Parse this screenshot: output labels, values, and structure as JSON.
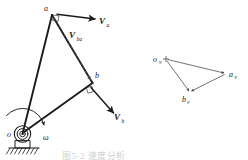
{
  "figure": {
    "caption_partial": "图5-2 速度分析",
    "colors": {
      "ink": "#1b1b1b",
      "thin_ink": "#3a3a3a",
      "dashed": "#555555",
      "background": "#ffffff",
      "caption_faded": "#cfcfcf"
    }
  },
  "mechanism": {
    "name": "four-bar-linkage",
    "points": [
      {
        "id": "o",
        "label": "o",
        "x": 22,
        "y": 134
      },
      {
        "id": "a",
        "label": "a",
        "x": 52,
        "y": 14
      },
      {
        "id": "b",
        "label": "b",
        "x": 93,
        "y": 83
      }
    ],
    "links": [
      {
        "id": "link-oa",
        "from": "o",
        "to": "a"
      },
      {
        "id": "link-ab",
        "from": "a",
        "to": "b"
      },
      {
        "id": "link-ob",
        "from": "o",
        "to": "b"
      }
    ],
    "ground_support": {
      "id": "ground-pivot",
      "label": "fixed-pivot-o",
      "x": 22,
      "y": 134
    },
    "angular_velocity": {
      "symbol": "ω",
      "label_x": 43,
      "label_y": 137,
      "direction": "clockwise"
    },
    "right_angle_markers": [
      {
        "id": "right-angle-a",
        "x": 55,
        "y": 16
      },
      {
        "id": "right-angle-b",
        "x": 89,
        "y": 90
      }
    ]
  },
  "vectors": [
    {
      "id": "v-a",
      "symbol": "V",
      "subscript": "a",
      "label_x": 99,
      "label_y": 23,
      "x1": 56,
      "y1": 14,
      "x2": 95,
      "y2": 18,
      "style": "solid"
    },
    {
      "id": "v-ba",
      "symbol": "V",
      "subscript": "ba",
      "label_x": 72,
      "label_y": 38,
      "x1": 55,
      "y1": 17,
      "x2": 91,
      "y2": 80,
      "style": "dashed"
    },
    {
      "id": "v-b",
      "symbol": "V",
      "subscript": "b",
      "label_x": 116,
      "label_y": 119,
      "x1": 91,
      "y1": 87,
      "x2": 113,
      "y2": 113,
      "style": "solid"
    }
  ],
  "velocity_polygon": {
    "name": "velocity-polygon",
    "pole": {
      "id": "ov",
      "symbol": "o",
      "subscript": "v",
      "x": 166,
      "y": 59,
      "label_x": 155,
      "label_y": 62
    },
    "vertices": [
      {
        "id": "av",
        "symbol": "a",
        "subscript": "v",
        "x": 225,
        "y": 74,
        "label_x": 229,
        "label_y": 76
      },
      {
        "id": "bv",
        "symbol": "b",
        "subscript": "v",
        "x": 190,
        "y": 92,
        "label_x": 183,
        "label_y": 101
      }
    ],
    "edges": [
      {
        "id": "edge-ov-av",
        "from": "ov",
        "to": "av",
        "meaning": "V_a"
      },
      {
        "id": "edge-ov-bv",
        "from": "ov",
        "to": "bv",
        "meaning": "V_b"
      },
      {
        "id": "edge-av-bv",
        "from": "av",
        "to": "bv",
        "meaning": "V_ba"
      }
    ]
  }
}
